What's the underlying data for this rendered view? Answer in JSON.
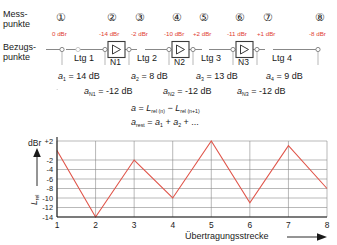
{
  "labels": {
    "messpunkte_line1": "Mess-",
    "messpunkte_line2": "punkte",
    "bezugspunkte_line1": "Bezugs-",
    "bezugspunkte_line2": "punkte"
  },
  "measure_points": [
    {
      "id": "1",
      "glyph": "①",
      "dbr": "0 dBr",
      "x": 62
    },
    {
      "id": "2",
      "glyph": "②",
      "dbr": "-14 dBr",
      "x": 113
    },
    {
      "id": "3",
      "glyph": "③",
      "dbr": "-2 dBr",
      "x": 141
    },
    {
      "id": "4",
      "glyph": "④",
      "dbr": "-10 dBr",
      "x": 178
    },
    {
      "id": "5",
      "glyph": "⑤",
      "dbr": "+2 dBr",
      "x": 205
    },
    {
      "id": "6",
      "glyph": "⑥",
      "dbr": "-11 dBr",
      "x": 241
    },
    {
      "id": "7",
      "glyph": "⑦",
      "dbr": "+1 dBr",
      "x": 269
    },
    {
      "id": "8",
      "glyph": "⑧",
      "dbr": "-8 dBr",
      "x": 321
    }
  ],
  "lines": [
    {
      "label": "Ltg 1",
      "x": 87
    },
    {
      "label": "Ltg 2",
      "x": 160
    },
    {
      "label": "Ltg 3",
      "x": 223
    },
    {
      "label": "Ltg 4",
      "x": 295
    }
  ],
  "amplifiers": [
    {
      "label": "N1",
      "x": 127,
      "symbol": "triangle-amplifier"
    },
    {
      "label": "N2",
      "x": 192,
      "symbol": "triangle-amplifier"
    },
    {
      "label": "N3",
      "x": 255,
      "symbol": "triangle-amplifier"
    }
  ],
  "line_attenuations": [
    {
      "sym": "a",
      "idx": "1",
      "eq": "= 14 dB",
      "x": 60
    },
    {
      "sym": "a",
      "idx": "2",
      "eq": "= 8 dB",
      "x": 133
    },
    {
      "sym": "a",
      "idx": "3",
      "eq": "= 13 dB",
      "x": 198
    },
    {
      "sym": "a",
      "idx": "4",
      "eq": "= 9 dB",
      "x": 268
    }
  ],
  "amp_gains": [
    {
      "sym": "a",
      "idx": "N1",
      "eq": "= -12 dB",
      "x": 86
    },
    {
      "sym": "a",
      "idx": "N2",
      "eq": "= -12 dB",
      "x": 165
    },
    {
      "sym": "a",
      "idx": "N3",
      "eq": "= -12 dB",
      "x": 238
    }
  ],
  "formulas": {
    "f1": {
      "lhs": "a",
      "eq": "=",
      "r1": "L",
      "r1sub": "rel (n)",
      "minus": "−",
      "r2": "L",
      "r2sub": "rel (n+1)"
    },
    "f2": {
      "lhs": "a",
      "lhssub": "rest",
      "eq": "=",
      "a1": "a",
      "a1sub": "1",
      "plus1": "+",
      "a2": "a",
      "a2sub": "2",
      "plus2": "+ ..."
    }
  },
  "chart_data": {
    "type": "line",
    "title": "",
    "xlabel": "Übertragungsstrecke",
    "ylabel": "L",
    "ylabel_sub": "rel",
    "yunit": "dBr",
    "x": [
      1,
      2,
      3,
      4,
      5,
      6,
      7,
      8
    ],
    "xticklabels": [
      "1",
      "2",
      "3",
      "4",
      "5",
      "6",
      "7",
      "8"
    ],
    "values": [
      0,
      -14,
      -2,
      -10,
      2,
      -11,
      1,
      -8
    ],
    "yticks": [
      2,
      -2,
      -4,
      -6,
      -8,
      -10,
      -12,
      -14
    ],
    "yticklabels": [
      "+2",
      "-2",
      "-4",
      "-6",
      "-8",
      "-10",
      "-12",
      "-14"
    ],
    "ylim": [
      -14,
      2
    ],
    "xlim": [
      1,
      8
    ],
    "grid": true,
    "legend": "none",
    "series_color": "#e0554a"
  },
  "colors": {
    "accent_red": "#e03c31",
    "curve": "#e0554a",
    "grid": "#8a8a8a",
    "axis": "#1a1a1a"
  }
}
